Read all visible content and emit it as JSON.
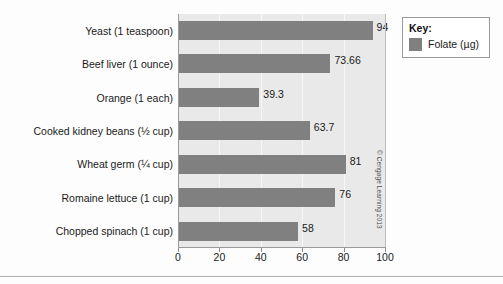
{
  "chart_data": {
    "type": "bar",
    "orientation": "horizontal",
    "title": "",
    "xlabel": "",
    "ylabel": "",
    "xlim": [
      0,
      100
    ],
    "xticks": [
      0,
      20,
      40,
      60,
      80,
      100
    ],
    "grid": true,
    "legend_position": "top-right",
    "categories": [
      "Yeast (1 teaspoon)",
      "Beef liver (1 ounce)",
      "Orange (1 each)",
      "Cooked kidney beans (½ cup)",
      "Wheat germ (¼ cup)",
      "Romaine lettuce (1 cup)",
      "Chopped spinach (1 cup)"
    ],
    "values": [
      94,
      73.66,
      39.3,
      63.7,
      81,
      76,
      58
    ],
    "value_labels": [
      "94",
      "73.66",
      "39.3",
      "63.7",
      "81",
      "76",
      "58"
    ],
    "series": [
      {
        "name": "Folate (µg)",
        "color": "#808080",
        "values": [
          94,
          73.66,
          39.3,
          63.7,
          81,
          76,
          58
        ]
      }
    ]
  },
  "legend": {
    "title": "Key:",
    "entries": [
      {
        "label": "Folate (µg)",
        "color": "#808080"
      }
    ]
  },
  "credit": "© Cengage Learning 2013",
  "colors": {
    "bar": "#808080",
    "plot_background": "#e9e9e9",
    "gridline": "#f7f7f7",
    "axis": "#9a9a9a",
    "text": "#1a1a1a",
    "page_background": "#ffffff"
  }
}
